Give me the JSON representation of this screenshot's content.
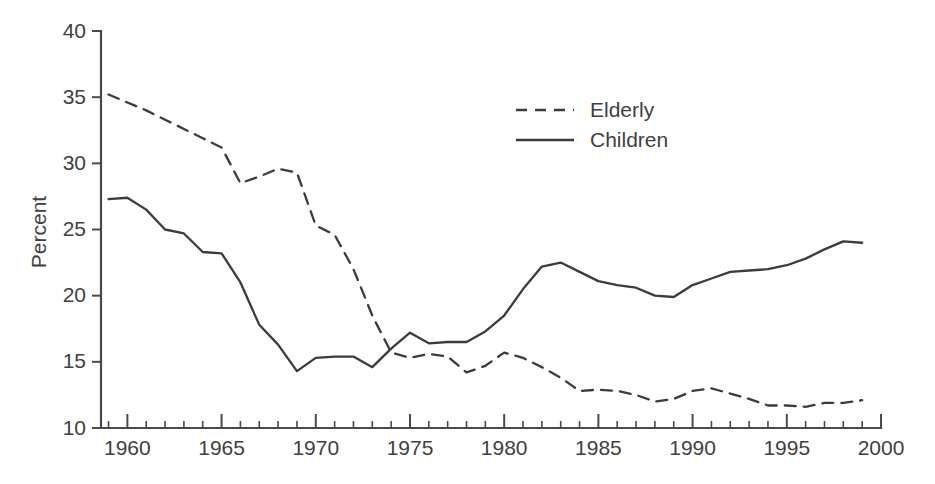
{
  "chart_data": {
    "type": "line",
    "title": "",
    "xlabel": "",
    "ylabel": "Percent",
    "xlim": [
      1958.6,
      2000
    ],
    "ylim": [
      10,
      40
    ],
    "yticks": [
      10,
      15,
      20,
      25,
      30,
      35,
      40
    ],
    "ytick_labels": [
      "10",
      "15",
      "20",
      "25",
      "30",
      "35",
      "40"
    ],
    "xticks_major": [
      1960,
      1965,
      1970,
      1975,
      1980,
      1985,
      1990,
      1995,
      2000
    ],
    "xtick_labels": [
      "1960",
      "1965",
      "1970",
      "1975",
      "1980",
      "1985",
      "1990",
      "1995",
      "2000"
    ],
    "xticks_minor_step": 1,
    "grid": false,
    "legend_position": "upper-center-right",
    "x": [
      1959,
      1960,
      1961,
      1962,
      1963,
      1964,
      1965,
      1966,
      1967,
      1968,
      1969,
      1970,
      1971,
      1972,
      1973,
      1974,
      1975,
      1976,
      1977,
      1978,
      1979,
      1980,
      1981,
      1982,
      1983,
      1984,
      1985,
      1986,
      1987,
      1988,
      1989,
      1990,
      1991,
      1992,
      1993,
      1994,
      1995,
      1996,
      1997,
      1998,
      1999
    ],
    "series": [
      {
        "name": "Elderly",
        "style": "dashed",
        "color": "#3c3c3c",
        "values": [
          35.2,
          34.6,
          34.0,
          33.3,
          32.6,
          31.9,
          31.2,
          28.5,
          29.0,
          29.6,
          29.3,
          25.3,
          24.6,
          22.0,
          18.5,
          15.7,
          15.3,
          15.6,
          15.4,
          14.2,
          14.7,
          15.7,
          15.3,
          14.6,
          13.8,
          12.8,
          12.9,
          12.8,
          12.5,
          12.0,
          12.2,
          12.8,
          13.0,
          12.6,
          12.2,
          11.7,
          11.7,
          11.6,
          11.9,
          11.9,
          12.1
        ]
      },
      {
        "name": "Children",
        "style": "solid",
        "color": "#3c3c3c",
        "values": [
          27.3,
          27.4,
          26.5,
          25.0,
          24.7,
          23.3,
          23.2,
          21.0,
          17.8,
          16.3,
          14.3,
          15.3,
          15.4,
          15.4,
          14.6,
          16.0,
          17.2,
          16.4,
          16.5,
          16.5,
          17.3,
          18.5,
          20.5,
          22.2,
          22.5,
          21.8,
          21.1,
          20.8,
          20.6,
          20.0,
          19.9,
          20.8,
          21.3,
          21.8,
          21.9,
          22.0,
          22.3,
          22.8,
          23.5,
          24.1,
          24.0
        ]
      }
    ],
    "legend": [
      {
        "label": "Elderly",
        "style": "dashed"
      },
      {
        "label": "Children",
        "style": "solid"
      }
    ]
  }
}
